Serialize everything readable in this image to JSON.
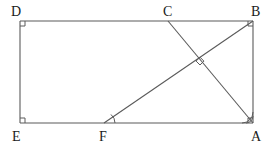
{
  "figure": {
    "type": "euclidean-geometry-diagram",
    "canvas": {
      "width": 274,
      "height": 149
    },
    "colors": {
      "background": "#ffffff",
      "stroke": "#5a5a5a",
      "label": "#1a1a1a"
    },
    "stroke_width": 1.1
  },
  "points": {
    "D": {
      "label": "D",
      "x": 20,
      "y": 21,
      "label_x": 11,
      "label_y": 5
    },
    "C": {
      "label": "C",
      "x": 168,
      "y": 21,
      "label_x": 163,
      "label_y": 5
    },
    "B": {
      "label": "B",
      "x": 253,
      "y": 21,
      "label_x": 251,
      "label_y": 5
    },
    "E": {
      "label": "E",
      "x": 20,
      "y": 123,
      "label_x": 12,
      "label_y": 130
    },
    "F": {
      "label": "F",
      "x": 104,
      "y": 123,
      "label_x": 99,
      "label_y": 130
    },
    "A": {
      "label": "A",
      "x": 253,
      "y": 123,
      "label_x": 251,
      "label_y": 130
    },
    "X": {
      "label": "",
      "x": 200,
      "y": 62,
      "label_x": 0,
      "label_y": 0
    }
  },
  "segments": [
    {
      "name": "side-DC-CB-top",
      "from": "D",
      "to": "B"
    },
    {
      "name": "side-BA-right",
      "from": "B",
      "to": "A"
    },
    {
      "name": "side-AF-FE-bottom",
      "from": "A",
      "to": "E"
    },
    {
      "name": "side-ED-left",
      "from": "E",
      "to": "D"
    },
    {
      "name": "diagonal-F-B",
      "from": "F",
      "to": "B"
    },
    {
      "name": "diagonal-C-A",
      "from": "C",
      "to": "A"
    }
  ],
  "markers": {
    "right_angles": [
      {
        "name": "right-angle-D",
        "at": "D",
        "size": 5
      },
      {
        "name": "right-angle-E",
        "at": "E",
        "size": 5
      },
      {
        "name": "right-angle-B",
        "at": "B",
        "size": 5
      },
      {
        "name": "right-angle-A",
        "at": "A",
        "size": 5
      },
      {
        "name": "right-angle-intersection",
        "at": "X",
        "size": 4
      }
    ],
    "angle_arcs": [
      {
        "name": "angle-arc-F",
        "at": "F",
        "arcs": 1,
        "radius": 11
      },
      {
        "name": "angle-arc-A",
        "at": "A",
        "arcs": 2,
        "radius": 11
      }
    ]
  },
  "labels_order": [
    "D",
    "C",
    "B",
    "E",
    "F",
    "A"
  ]
}
